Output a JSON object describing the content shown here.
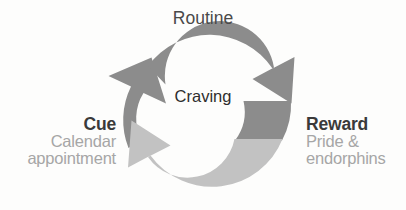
{
  "diagram": {
    "type": "habit-loop-cycle",
    "title_label": "Routine",
    "center_label": "Craving",
    "background_color": "#fdfdfc",
    "nodes": [
      {
        "id": "routine",
        "label": "Routine",
        "sub_label": "",
        "position": "top",
        "label_color": "#4a4a4a"
      },
      {
        "id": "cue",
        "label": "Cue",
        "sub_label_line1": "Calendar",
        "sub_label_line2": "appointment",
        "position": "left",
        "label_color": "#3a3a3a",
        "sub_label_color": "#a6a6a6"
      },
      {
        "id": "reward",
        "label": "Reward",
        "sub_label_line1": "Pride &",
        "sub_label_line2": "endorphins",
        "position": "right",
        "label_color": "#3a3a3a",
        "sub_label_color": "#a6a6a6"
      }
    ],
    "center": {
      "label": "Craving",
      "label_color": "#2e2e2e"
    },
    "arrows": [
      {
        "id": "arrow-cue-to-routine",
        "name": "cue-to-routine-arrow",
        "from": "cue",
        "to": "routine",
        "color": "#8c8c8c",
        "direction": "up-right"
      },
      {
        "id": "arrow-routine-to-reward",
        "name": "routine-to-reward-arrow",
        "from": "routine",
        "to": "reward",
        "color": "#8c8c8c",
        "direction": "down-right"
      },
      {
        "id": "arrow-reward-to-cue",
        "name": "reward-to-cue-arrow",
        "from": "reward",
        "to": "cue",
        "color": "#c2c2c2",
        "direction": "up-left"
      }
    ],
    "colors": {
      "arrow_dark": "#8c8c8c",
      "arrow_light": "#c2c2c2",
      "text_dark": "#3a3a3a",
      "text_muted": "#a6a6a6"
    }
  }
}
